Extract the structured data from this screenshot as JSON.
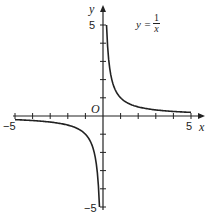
{
  "chart_data": {
    "type": "line",
    "equation": {
      "lhs": "y",
      "numerator": "1",
      "denominator": "x"
    },
    "xlabel": "x",
    "ylabel": "y",
    "origin_label": "O",
    "xlim": [
      -5,
      5
    ],
    "ylim": [
      -5,
      5
    ],
    "x_tick_labels": [
      "-5",
      "5"
    ],
    "y_tick_labels": [
      "5",
      "-5"
    ],
    "x_ticks": [
      -5,
      -4,
      -3,
      -2,
      -1,
      1,
      2,
      3,
      4,
      5
    ],
    "y_ticks": [
      -5,
      -4,
      -3,
      -2,
      -1,
      1,
      2,
      3,
      4,
      5
    ],
    "grid": false,
    "series": [
      {
        "name": "positive branch",
        "x": [
          0.2,
          0.25,
          0.5,
          1,
          2,
          3,
          4,
          5
        ],
        "y": [
          5,
          4,
          2,
          1,
          0.5,
          0.333,
          0.25,
          0.2
        ]
      },
      {
        "name": "negative branch",
        "x": [
          -5,
          -4,
          -3,
          -2,
          -1,
          -0.5,
          -0.25,
          -0.2
        ],
        "y": [
          -0.2,
          -0.25,
          -0.333,
          -0.5,
          -1,
          -2,
          -4,
          -5
        ]
      }
    ],
    "line_color": "#222222"
  },
  "labels": {
    "x_axis": "x",
    "y_axis": "y",
    "origin": "O",
    "x_min": "−5",
    "x_max": "5",
    "y_max": "5",
    "y_min": "−5",
    "eq_lhs": "y =",
    "eq_num": "1",
    "eq_den": "x"
  }
}
